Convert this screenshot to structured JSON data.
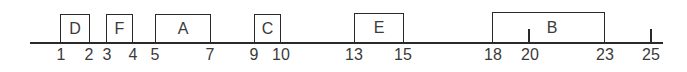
{
  "diagram": {
    "type": "interval-timeline",
    "axis": {
      "x_start_px": 30,
      "x_end_px": 663,
      "y_px": 43
    },
    "intervals": [
      {
        "label": "D",
        "start": 1,
        "end": 2,
        "x0": 60,
        "x1": 90,
        "top": 14
      },
      {
        "label": "F",
        "start": 3,
        "end": 4,
        "x0": 106,
        "x1": 133,
        "top": 14
      },
      {
        "label": "A",
        "start": 5,
        "end": 7,
        "x0": 155,
        "x1": 211,
        "top": 14
      },
      {
        "label": "C",
        "start": 9,
        "end": 10,
        "x0": 254,
        "x1": 281,
        "top": 14
      },
      {
        "label": "E",
        "start": 13,
        "end": 15,
        "x0": 354,
        "x1": 404,
        "top": 13
      },
      {
        "label": "B",
        "start": 18,
        "end": 23,
        "x0": 492,
        "x1": 605,
        "top": 12
      }
    ],
    "standalone_ticks": [
      {
        "value": 20,
        "x": 529,
        "top": 29
      },
      {
        "value": 25,
        "x": 651,
        "top": 29
      }
    ],
    "tick_labels": [
      {
        "text": "1",
        "x": 61
      },
      {
        "text": "2",
        "x": 89
      },
      {
        "text": "3",
        "x": 107
      },
      {
        "text": "4",
        "x": 133
      },
      {
        "text": "5",
        "x": 155
      },
      {
        "text": "7",
        "x": 210
      },
      {
        "text": "9",
        "x": 254
      },
      {
        "text": "10",
        "x": 281
      },
      {
        "text": "13",
        "x": 354
      },
      {
        "text": "15",
        "x": 403
      },
      {
        "text": "18",
        "x": 493
      },
      {
        "text": "20",
        "x": 530
      },
      {
        "text": "23",
        "x": 605
      },
      {
        "text": "25",
        "x": 651
      }
    ],
    "colors": {
      "line": "#2a2a2a",
      "text": "#3a3a3a",
      "background": "#ffffff"
    }
  }
}
